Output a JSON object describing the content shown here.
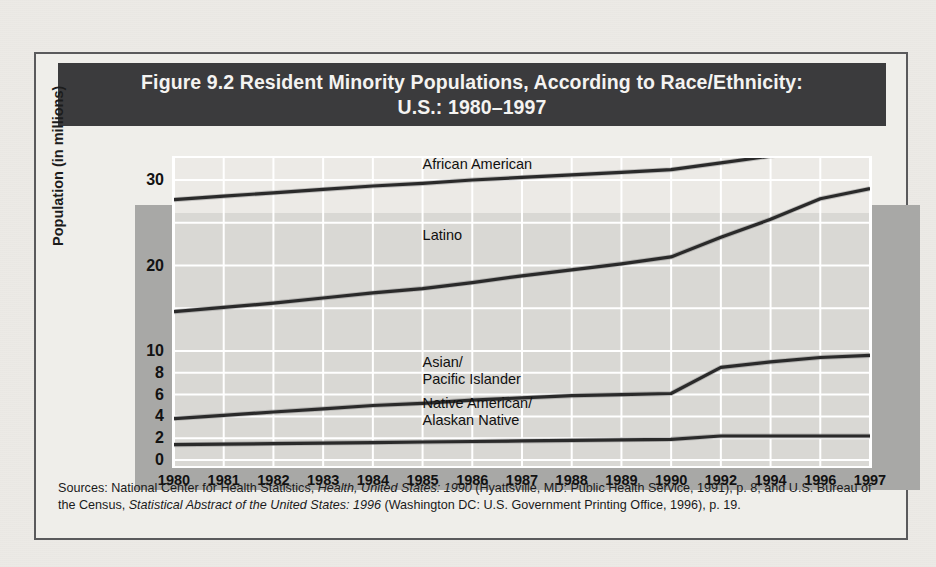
{
  "figure": {
    "title_line1": "Figure 9.2  Resident Minority Populations, According to Race/Ethnicity:",
    "title_line2": "U.S.: 1980–1997",
    "source_prefix": "Sources: National Center for Health Statistics, ",
    "source_italic1": "Health, United States: 1990",
    "source_mid1": " (Hyattsville, MD: Public Health Service, 1991),  p. 8; and U.S. Bureau of the Census, ",
    "source_italic2": "Statistical Abstract of the United States: 1996",
    "source_mid2": " (Washington DC: U.S. Government Printing Office, 1996), p. 19."
  },
  "colors": {
    "title_bar": "#3b3b3d",
    "title_text": "#f4f3f1",
    "frame_border": "#5a5a5c",
    "page_bg": "#eceae6",
    "plot_bg": "#d9d8d4",
    "plot_shadow": "#a8a8a6",
    "gridline": "#ffffff",
    "series_line": "#2a2a2a"
  },
  "chart_data": {
    "type": "line",
    "title": "Figure 9.2  Resident Minority Populations, According to Race/Ethnicity: U.S.: 1980–1997",
    "xlabel": "",
    "ylabel": "Population (in millions)",
    "grid": true,
    "legend_position": "inline-labels",
    "x": [
      1980,
      1981,
      1982,
      1983,
      1984,
      1985,
      1986,
      1987,
      1988,
      1989,
      1990,
      1992,
      1994,
      1996,
      1997
    ],
    "x_tick_labels": [
      "1980",
      "1981",
      "1982",
      "1983",
      "1984",
      "1985",
      "1986",
      "1987",
      "1988",
      "1989",
      "1990",
      "1992",
      "1994",
      "1996",
      "1997"
    ],
    "y_tick_labels": [
      "0",
      "2",
      "4",
      "6",
      "8",
      "10",
      "20",
      "30"
    ],
    "y_tick_values": [
      0,
      2,
      4,
      6,
      8,
      10,
      20,
      30
    ],
    "y_axis_note": "broken / compressed scale above 10",
    "ylim": [
      0,
      35
    ],
    "series": [
      {
        "name": "African American",
        "values": [
          27.7,
          28.1,
          28.5,
          28.9,
          29.3,
          29.6,
          30.0,
          30.3,
          30.6,
          30.9,
          31.2,
          32.0,
          32.8,
          33.6,
          34.0
        ],
        "label_x": 1985.0,
        "label_y": 31.8
      },
      {
        "name": "Latino",
        "values": [
          14.6,
          15.1,
          15.6,
          16.2,
          16.8,
          17.3,
          18.0,
          18.8,
          19.5,
          20.2,
          21.0,
          23.3,
          25.4,
          27.8,
          29.0
        ],
        "label_x": 1985.0,
        "label_y": 23.5
      },
      {
        "name": "Asian/Pacific Islander",
        "values": [
          3.8,
          4.1,
          4.4,
          4.7,
          5.0,
          5.2,
          5.5,
          5.7,
          5.9,
          6.0,
          6.1,
          8.5,
          9.0,
          9.4,
          9.6
        ],
        "label_x": 1985.0,
        "label_y": 8.9
      },
      {
        "name": "Native American/Alaskan Native",
        "values": [
          1.4,
          1.45,
          1.5,
          1.55,
          1.6,
          1.65,
          1.7,
          1.75,
          1.8,
          1.85,
          1.9,
          2.2,
          2.2,
          2.2,
          2.2
        ],
        "label_x": 1985.0,
        "label_y": 5.1
      }
    ]
  }
}
